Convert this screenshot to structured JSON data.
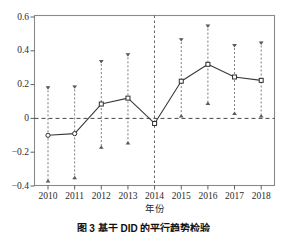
{
  "chart_data": {
    "type": "line",
    "title": "",
    "xlabel": "年份",
    "ylabel": "",
    "categories": [
      "2010",
      "2011",
      "2012",
      "2013",
      "2014",
      "2015",
      "2016",
      "2017",
      "2018"
    ],
    "values": [
      -0.1,
      -0.09,
      0.085,
      0.12,
      -0.03,
      0.22,
      0.32,
      0.245,
      0.225
    ],
    "error_low": [
      -0.38,
      -0.36,
      -0.18,
      -0.155,
      -0.03,
      0.005,
      0.08,
      0.02,
      0.005
    ],
    "error_high": [
      0.19,
      0.195,
      0.345,
      0.385,
      -0.03,
      0.475,
      0.555,
      0.44,
      0.455
    ],
    "ylim": [
      -0.44,
      0.645
    ],
    "yticks": [
      0.6,
      0.4,
      0.2,
      0,
      -0.2,
      -0.4
    ],
    "ytick_labels": [
      "0.6",
      "0.4",
      "0.2",
      "0",
      "−0.2",
      "−0.4"
    ],
    "xtick_labels": [
      "2010",
      "2011",
      "2012",
      "2013",
      "2014",
      "2015",
      "2016",
      "2017",
      "2018"
    ],
    "grid": false,
    "legend": "none",
    "zero_reference_line": 0,
    "event_marker_year": "2014",
    "marker_style": "open-circle-square",
    "errorbar_cap_style": "triangle",
    "line_color": "#3a3a3a",
    "errorbar_color": "#6e6e6e",
    "frame_color": "#8a8a8a"
  },
  "axes": {
    "x_axis_title": "年份",
    "y_axis_title": ""
  },
  "caption": {
    "text": "图 3  基于 DID 的平行趋势检验"
  }
}
